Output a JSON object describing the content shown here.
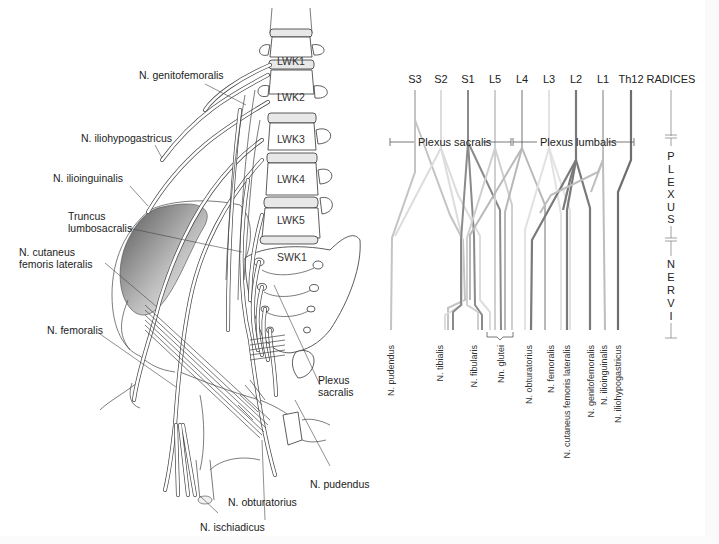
{
  "anatomy": {
    "vertebrae": [
      {
        "label": "LWK1",
        "x": 285,
        "y": 41
      },
      {
        "label": "LWK2",
        "x": 285,
        "y": 97
      },
      {
        "label": "LWK3",
        "x": 285,
        "y": 140
      },
      {
        "label": "LWK4",
        "x": 285,
        "y": 180
      },
      {
        "label": "LWK5",
        "x": 285,
        "y": 221
      },
      {
        "label": "SWK1",
        "x": 283,
        "y": 258
      }
    ],
    "labels": {
      "genitofemoralis": "N. genitofemoralis",
      "iliohypogastricus": "N. iliohypogastricus",
      "ilioinguinalis": "N. ilioinguinalis",
      "truncus_line1": "Truncus",
      "truncus_line2": "lumbosacralis",
      "cutaneus_line1": "N. cutaneus",
      "cutaneus_line2": "femoris lateralis",
      "femoralis": "N. femoralis",
      "plexus_sacralis_line1": "Plexus",
      "plexus_sacralis_line2": "sacralis",
      "pudendus": "N. pudendus",
      "obturatorius": "N. obturatorius",
      "ischiadicus": "N. ischiadicus"
    }
  },
  "schematic": {
    "roots_header": "RADICES",
    "roots": [
      {
        "label": "S3",
        "x": 415,
        "color": "#c4c4c4"
      },
      {
        "label": "S2",
        "x": 441,
        "color": "#dcdcdc"
      },
      {
        "label": "S1",
        "x": 468,
        "color": "#8a8a8a"
      },
      {
        "label": "L5",
        "x": 495,
        "color": "#cfcfcf"
      },
      {
        "label": "L4",
        "x": 522,
        "color": "#b8b8b8"
      },
      {
        "label": "L3",
        "x": 549,
        "color": "#e2e2e2"
      },
      {
        "label": "L2",
        "x": 576,
        "color": "#7a7a7a"
      },
      {
        "label": "L1",
        "x": 603,
        "color": "#bdbdbd"
      },
      {
        "label": "Th12",
        "x": 631,
        "color": "#6e6e6e"
      }
    ],
    "plexus_sacralis": "Plexus sacralis",
    "plexus_lumbalis": "Plexus lumbalis",
    "side_scale": {
      "plexus_letters": [
        "P",
        "L",
        "E",
        "X",
        "U",
        "S"
      ],
      "nervi_letters": [
        "N",
        "E",
        "R",
        "V",
        "I"
      ]
    },
    "nerves": [
      {
        "label": "N. pudendus",
        "x": 391
      },
      {
        "label": "N. tibialis",
        "x": 440
      },
      {
        "label": "N. fibularis",
        "x": 474
      },
      {
        "label": "Nn. glutei",
        "x": 501
      },
      {
        "label": "N. obturatorius",
        "x": 529
      },
      {
        "label": "N. femoralis",
        "x": 551
      },
      {
        "label": "N. cutaneus femoris lateralis",
        "x": 567
      },
      {
        "label": "N. genitofemoralis",
        "x": 591
      },
      {
        "label": "N. ilioinguinalis",
        "x": 604
      },
      {
        "label": "N. iliohypogastricus",
        "x": 618
      }
    ]
  }
}
